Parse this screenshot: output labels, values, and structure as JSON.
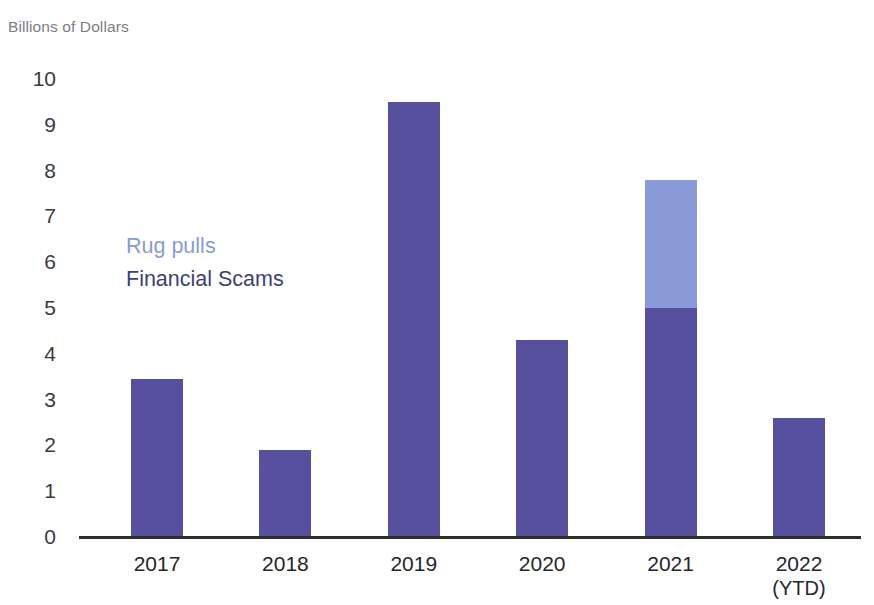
{
  "chart_data": {
    "type": "bar",
    "stacked": true,
    "title": "Billions of Dollars",
    "xlabel": "",
    "ylabel": "Billions of Dollars",
    "categories": [
      "2017",
      "2018",
      "2019",
      "2020",
      "2021",
      "2022"
    ],
    "category_sublabels": [
      "",
      "",
      "",
      "",
      "",
      "(YTD)"
    ],
    "series": [
      {
        "name": "Financial Scams",
        "color": "#554f9e",
        "values": [
          3.45,
          1.9,
          9.5,
          4.3,
          5.0,
          2.6
        ]
      },
      {
        "name": "Rug pulls",
        "color": "#8a9ad8",
        "values": [
          0,
          0,
          0,
          0,
          2.8,
          0
        ]
      }
    ],
    "totals": [
      3.45,
      1.9,
      9.5,
      4.3,
      7.8,
      2.6
    ],
    "ylim": [
      0,
      10
    ],
    "ytick_values": [
      10,
      9,
      8,
      7,
      6,
      5,
      4,
      3,
      2,
      1,
      0
    ],
    "ytick_labels": [
      "10",
      "9",
      "8",
      "7",
      "6",
      "5",
      "4",
      "3",
      "2",
      "1",
      "0"
    ],
    "grid": false,
    "legend_position": "inside-left",
    "legend_entries": [
      {
        "label": "Rug pulls",
        "color": "#8a9ad8"
      },
      {
        "label": "Financial Scams",
        "color": "#3b3f7d"
      }
    ]
  },
  "colors": {
    "financial_scams": "#554f9e",
    "rug_pulls": "#8a9ad8",
    "legend_rug_pulls_text": "#8a9ad8",
    "legend_financial_scams_text": "#3b3f7d",
    "axis_line": "#2e2e33",
    "tick_text": "#3b3b40",
    "title_text": "#7d7d82",
    "background": "#ffffff"
  }
}
